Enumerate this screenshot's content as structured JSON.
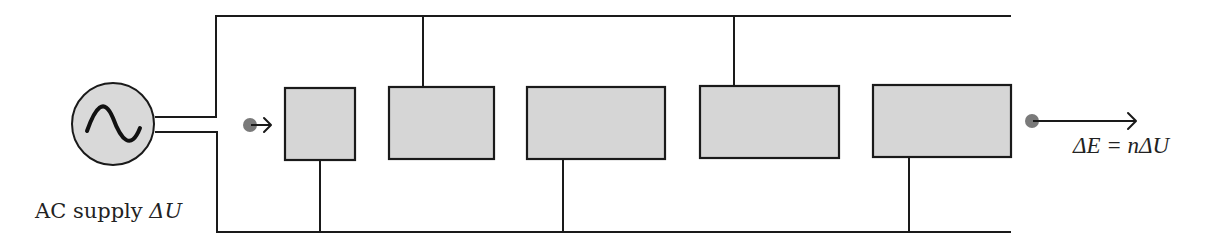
{
  "diagram": {
    "type": "circuit-block-diagram",
    "source": {
      "icon": "ac-source-icon",
      "label_text": "AC supply ",
      "label_symbol": "ΔU"
    },
    "stages": [
      {
        "id": 1,
        "connection": "bottom-rail"
      },
      {
        "id": 2,
        "connection": "top-rail"
      },
      {
        "id": 3,
        "connection": "bottom-rail"
      },
      {
        "id": 4,
        "connection": "top-rail"
      },
      {
        "id": 5,
        "connection": "bottom-rail"
      }
    ],
    "input": {
      "marker": "particle-dot",
      "arrow": "right-arrow"
    },
    "output": {
      "marker": "particle-dot",
      "arrow": "right-arrow",
      "label": "ΔE = nΔU"
    },
    "colors": {
      "wire": "#1a1a1a",
      "box_fill": "#d6d6d6",
      "source_fill": "#d9d9d9",
      "dot": "#7a7a7a",
      "background": "#ffffff"
    }
  }
}
